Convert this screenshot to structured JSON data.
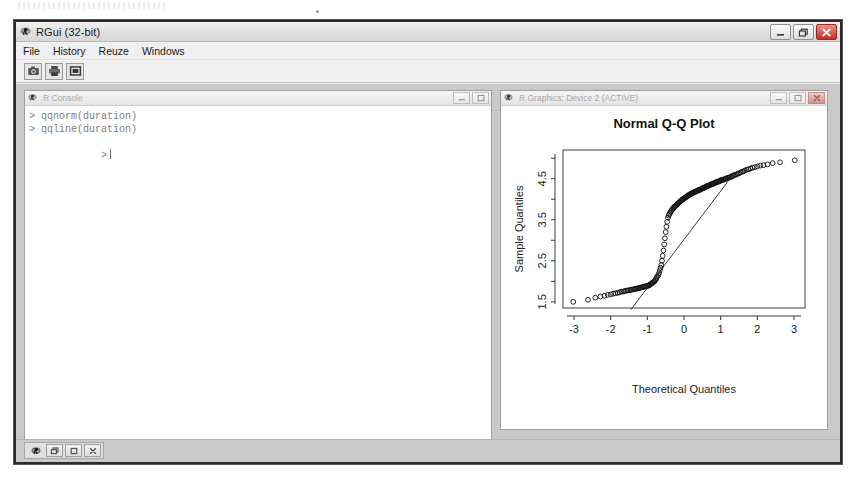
{
  "window": {
    "title": "RGui (32-bit)",
    "app_icon": "r-logo-icon",
    "buttons": {
      "minimize": "minimize-icon",
      "restore": "restore-icon",
      "close": "close-icon",
      "close_glyph": "✕"
    }
  },
  "menubar": {
    "items": [
      {
        "label": "File"
      },
      {
        "label": "History"
      },
      {
        "label": "Reuze"
      },
      {
        "label": "Windows"
      }
    ]
  },
  "toolbar": {
    "buttons": [
      {
        "name": "open-script-icon",
        "tooltip": "Open script"
      },
      {
        "name": "print-icon",
        "tooltip": "Print"
      },
      {
        "name": "tile-windows-icon",
        "tooltip": "Windows"
      }
    ]
  },
  "console": {
    "title": "R Console",
    "icon": "r-logo-icon",
    "buttons": {
      "minimize": "minimize-icon",
      "maximize": "maximize-icon"
    },
    "lines": [
      "> qqnorm(duration)",
      "> qqline(duration)",
      "> "
    ],
    "prompt": ">",
    "cursor_visible": true
  },
  "graphics": {
    "title": "R Graphics: Device 2 (ACTIVE)",
    "icon": "r-logo-icon",
    "buttons": {
      "minimize": "minimize-icon",
      "maximize": "maximize-icon",
      "close": "close-icon"
    }
  },
  "taskbar": {
    "minimized_window_icon": "r-logo-icon",
    "buttons": [
      {
        "name": "restore-window-button",
        "glyph": "restore-icon"
      },
      {
        "name": "maximize-window-button",
        "glyph": "maximize-icon"
      },
      {
        "name": "close-window-button",
        "glyph": "close-icon"
      }
    ]
  },
  "colors": {
    "window_frame": "#2b2b2b",
    "chrome_bg": "#efefef",
    "mdi_bg": "#c9c9c9",
    "plot_ink": "#000000",
    "console_text": "#7d7d7d",
    "close_red": "#c0332b"
  },
  "chart_data": {
    "type": "scatter",
    "title": "Normal Q-Q Plot",
    "xlabel": "Theoretical Quantiles",
    "ylabel": "Sample Quantiles",
    "xlim": [
      -3.3,
      3.3
    ],
    "ylim": [
      1.35,
      5.2
    ],
    "xticks": [
      -3,
      -2,
      -1,
      0,
      1,
      2,
      3
    ],
    "xtick_labels": [
      "-3",
      "-2",
      "-1",
      "0",
      "1",
      "2",
      "3"
    ],
    "yticks": [
      1.5,
      2.5,
      3.5,
      4.5
    ],
    "ytick_labels": [
      "1.5",
      "2.5",
      "3.5",
      "4.5"
    ],
    "yminor_ticks": [
      2.0,
      3.0,
      4.0,
      5.0
    ],
    "grid": false,
    "legend": null,
    "point_marker": "open-circle",
    "reference_line": {
      "name": "qqline",
      "slope": 1.18,
      "intercept": 3.02,
      "x_start": -1.45,
      "x_end": 1.2,
      "description": "line through first and third quartiles"
    },
    "series": [
      {
        "name": "duration",
        "description": "Old Faithful eruption duration quantiles vs normal quantiles (bimodal S-curve)",
        "x": [
          -3.02,
          -2.62,
          -2.42,
          -2.28,
          -2.17,
          -2.08,
          -2.0,
          -1.93,
          -1.87,
          -1.81,
          -1.76,
          -1.71,
          -1.66,
          -1.62,
          -1.58,
          -1.54,
          -1.5,
          -1.46,
          -1.43,
          -1.39,
          -1.36,
          -1.33,
          -1.3,
          -1.27,
          -1.24,
          -1.21,
          -1.18,
          -1.15,
          -1.13,
          -1.1,
          -1.07,
          -1.05,
          -1.02,
          -1.0,
          -0.97,
          -0.95,
          -0.93,
          -0.9,
          -0.88,
          -0.86,
          -0.83,
          -0.81,
          -0.79,
          -0.77,
          -0.75,
          -0.73,
          -0.7,
          -0.68,
          -0.66,
          -0.64,
          -0.62,
          -0.6,
          -0.58,
          -0.56,
          -0.54,
          -0.52,
          -0.5,
          -0.48,
          -0.46,
          -0.44,
          -0.42,
          -0.4,
          -0.38,
          -0.36,
          -0.34,
          -0.32,
          -0.3,
          -0.28,
          -0.26,
          -0.24,
          -0.22,
          -0.2,
          -0.18,
          -0.16,
          -0.14,
          -0.12,
          -0.1,
          -0.08,
          -0.06,
          -0.04,
          -0.02,
          0.0,
          0.02,
          0.04,
          0.06,
          0.08,
          0.1,
          0.12,
          0.14,
          0.16,
          0.18,
          0.2,
          0.22,
          0.24,
          0.26,
          0.28,
          0.3,
          0.32,
          0.34,
          0.36,
          0.38,
          0.4,
          0.42,
          0.44,
          0.46,
          0.48,
          0.5,
          0.52,
          0.54,
          0.56,
          0.58,
          0.6,
          0.62,
          0.64,
          0.66,
          0.68,
          0.7,
          0.73,
          0.75,
          0.77,
          0.79,
          0.81,
          0.83,
          0.86,
          0.88,
          0.9,
          0.93,
          0.95,
          0.97,
          1.0,
          1.02,
          1.05,
          1.07,
          1.1,
          1.13,
          1.15,
          1.18,
          1.21,
          1.24,
          1.27,
          1.3,
          1.33,
          1.36,
          1.39,
          1.43,
          1.46,
          1.5,
          1.54,
          1.58,
          1.62,
          1.66,
          1.71,
          1.76,
          1.81,
          1.87,
          1.93,
          2.0,
          2.08,
          2.17,
          2.28,
          2.42,
          2.62,
          3.02
        ],
        "y": [
          1.5,
          1.55,
          1.6,
          1.63,
          1.65,
          1.67,
          1.68,
          1.7,
          1.71,
          1.72,
          1.73,
          1.75,
          1.75,
          1.76,
          1.77,
          1.78,
          1.78,
          1.79,
          1.8,
          1.8,
          1.81,
          1.82,
          1.82,
          1.83,
          1.83,
          1.84,
          1.85,
          1.85,
          1.86,
          1.87,
          1.87,
          1.88,
          1.88,
          1.89,
          1.9,
          1.9,
          1.92,
          1.93,
          1.95,
          1.97,
          1.98,
          2.0,
          2.02,
          2.05,
          2.08,
          2.12,
          2.15,
          2.2,
          2.27,
          2.33,
          2.4,
          2.5,
          2.62,
          2.75,
          2.9,
          3.05,
          3.2,
          3.33,
          3.45,
          3.55,
          3.6,
          3.63,
          3.67,
          3.7,
          3.73,
          3.75,
          3.77,
          3.8,
          3.82,
          3.83,
          3.85,
          3.87,
          3.88,
          3.9,
          3.92,
          3.93,
          3.95,
          3.97,
          3.98,
          4.0,
          4.0,
          4.02,
          4.03,
          4.05,
          4.05,
          4.07,
          4.08,
          4.1,
          4.1,
          4.12,
          4.13,
          4.13,
          4.15,
          4.15,
          4.17,
          4.17,
          4.18,
          4.18,
          4.2,
          4.2,
          4.22,
          4.22,
          4.23,
          4.23,
          4.25,
          4.25,
          4.27,
          4.27,
          4.28,
          4.28,
          4.3,
          4.3,
          4.32,
          4.32,
          4.33,
          4.33,
          4.35,
          4.35,
          4.37,
          4.37,
          4.38,
          4.38,
          4.4,
          4.4,
          4.42,
          4.42,
          4.43,
          4.43,
          4.45,
          4.45,
          4.47,
          4.47,
          4.48,
          4.48,
          4.5,
          4.5,
          4.52,
          4.52,
          4.53,
          4.55,
          4.55,
          4.57,
          4.58,
          4.6,
          4.6,
          4.62,
          4.63,
          4.65,
          4.67,
          4.68,
          4.7,
          4.72,
          4.73,
          4.75,
          4.77,
          4.78,
          4.8,
          4.82,
          4.83,
          4.85,
          4.88,
          4.9,
          4.95
        ]
      }
    ]
  }
}
